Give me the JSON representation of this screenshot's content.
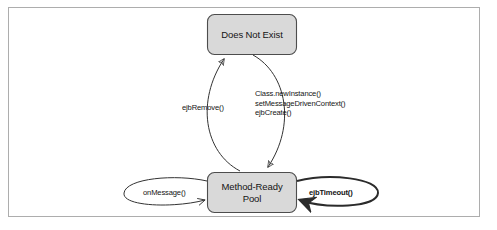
{
  "diagram": {
    "type": "state-diagram",
    "frame": {
      "border_color": "#adadad",
      "background": "#ffffff"
    },
    "states": [
      {
        "id": "does-not-exist",
        "label": "Does Not Exist",
        "shape": "rounded-rectangle",
        "fill": "#d9d9d9",
        "stroke": "#4d4d4d"
      },
      {
        "id": "method-ready-pool",
        "label_line1": "Method-Ready",
        "label_line2": "Pool",
        "shape": "rounded-rectangle",
        "fill": "#d9d9d9",
        "stroke": "#4d4d4d"
      }
    ],
    "transitions": [
      {
        "id": "create-transition",
        "from": "does-not-exist",
        "to": "method-ready-pool",
        "label_line1": "Class.newInstance()",
        "label_line2": "setMessageDrivenContext()",
        "label_line3": "ejbCreate()",
        "style": "curved-arrow",
        "direction": "down"
      },
      {
        "id": "remove-transition",
        "from": "method-ready-pool",
        "to": "does-not-exist",
        "label": "ejbRemove()",
        "style": "curved-arrow",
        "direction": "up"
      },
      {
        "id": "on-message-transition",
        "from": "method-ready-pool",
        "to": "method-ready-pool",
        "label": "onMessage()",
        "style": "self-loop-ellipse",
        "side": "left",
        "emphasis": "normal"
      },
      {
        "id": "ejb-timeout-transition",
        "from": "method-ready-pool",
        "to": "method-ready-pool",
        "label": "ejbTimeout()",
        "style": "self-loop-ellipse",
        "side": "right",
        "emphasis": "bold"
      }
    ],
    "colors": {
      "box_fill": "#d9d9d9",
      "box_stroke": "#4d4d4d",
      "line": "#333333",
      "text": "#141414",
      "frame": "#adadad"
    }
  }
}
